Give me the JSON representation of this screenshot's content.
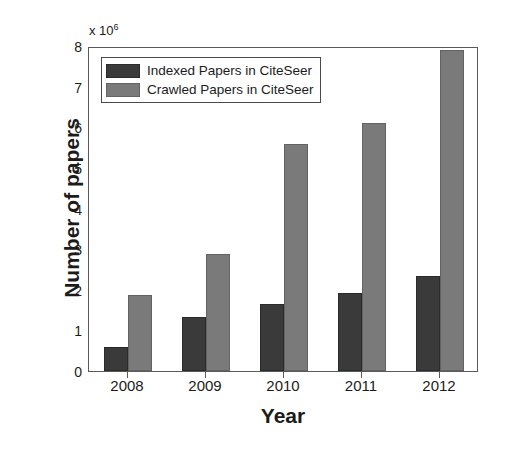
{
  "chart_data": {
    "type": "bar",
    "title": "",
    "subtitle": "",
    "xlabel": "Year",
    "ylabel": "Number of papers",
    "y_multiplier_label": "x 10",
    "y_multiplier_exponent": "6",
    "categories": [
      "2008",
      "2009",
      "2010",
      "2011",
      "2012"
    ],
    "series": [
      {
        "name": "Indexed Papers in CiteSeer",
        "color": "#3a3a3a",
        "values": [
          0.6,
          1.33,
          1.65,
          1.92,
          2.33
        ]
      },
      {
        "name": "Crawled Papers in CiteSeer",
        "color": "#7a7a7a",
        "values": [
          1.88,
          2.87,
          5.58,
          6.1,
          7.9
        ]
      }
    ],
    "yticks": [
      "0",
      "1",
      "2",
      "3",
      "4",
      "5",
      "6",
      "7",
      "8"
    ],
    "ylim": [
      0,
      8
    ],
    "units": "millions of papers",
    "grid": false,
    "legend_position": "top-left",
    "legend_entries": [
      "Indexed Papers in CiteSeer",
      "Crawled Papers in CiteSeer"
    ]
  },
  "axes": {
    "y_title": "Number of papers",
    "x_title": "Year",
    "y_exponent_prefix": "x 10",
    "y_exponent_power": "6"
  },
  "colors": {
    "indexed": "#3a3a3a",
    "crawled": "#7a7a7a",
    "axis": "#5a5a5a",
    "text": "#1b1b1b",
    "background": "#ffffff"
  }
}
